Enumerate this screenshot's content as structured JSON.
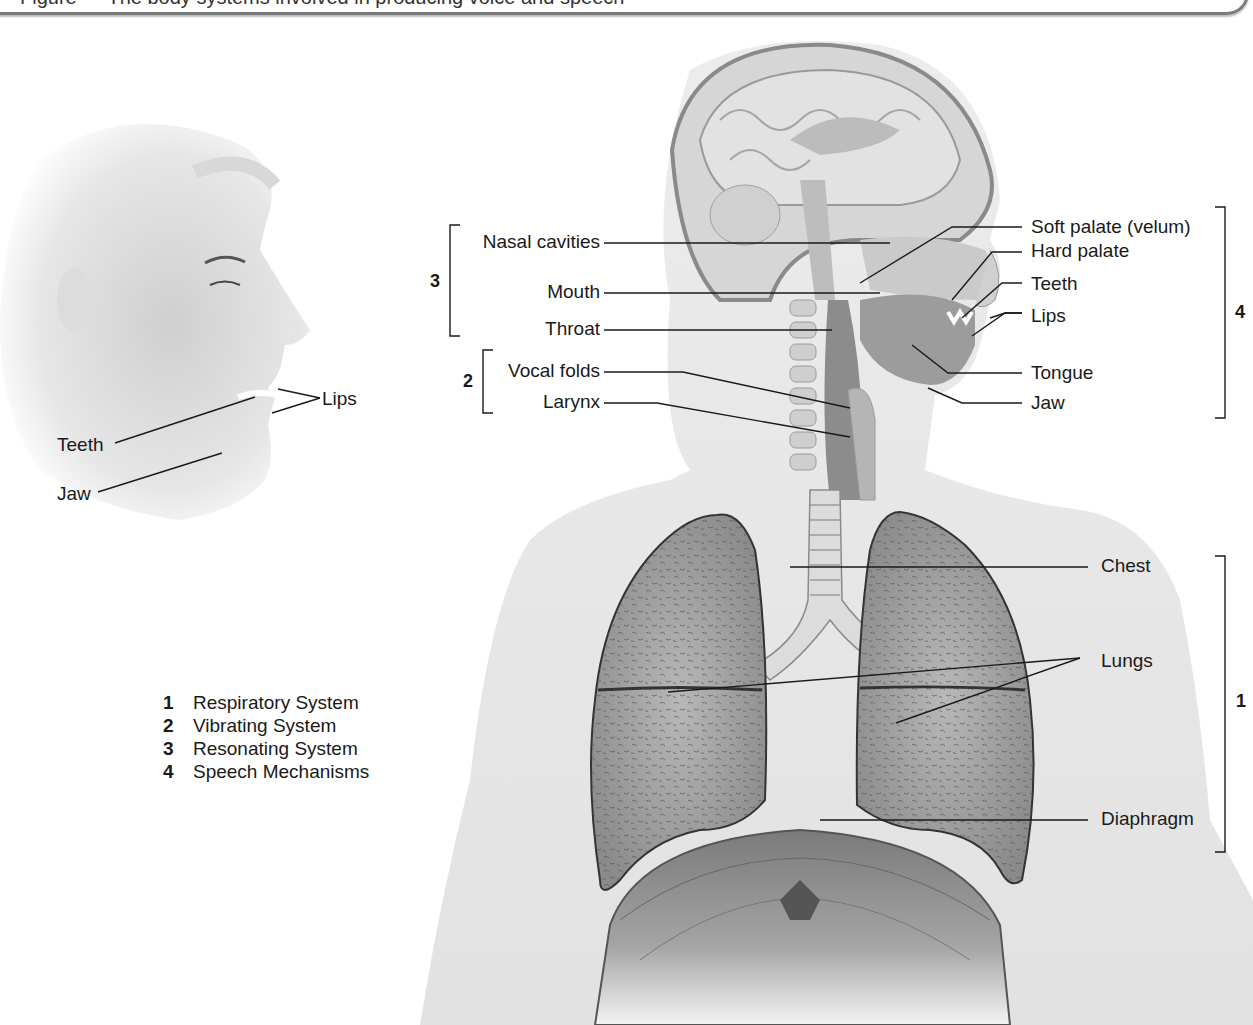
{
  "figure": {
    "caption_partial": "Figure — The body systems involved in producing voice and speech",
    "background": "#ffffff",
    "ink_color": "#1a1a1a"
  },
  "face_labels": {
    "lips": "Lips",
    "teeth": "Teeth",
    "jaw": "Jaw"
  },
  "left_labels": [
    {
      "id": "nasal_cavities",
      "text": "Nasal cavities"
    },
    {
      "id": "mouth",
      "text": "Mouth"
    },
    {
      "id": "throat",
      "text": "Throat"
    },
    {
      "id": "vocal_folds",
      "text": "Vocal folds"
    },
    {
      "id": "larynx",
      "text": "Larynx"
    }
  ],
  "right_labels": [
    {
      "id": "soft_palate",
      "text": "Soft palate (velum)"
    },
    {
      "id": "hard_palate",
      "text": "Hard palate"
    },
    {
      "id": "teeth",
      "text": "Teeth"
    },
    {
      "id": "lips",
      "text": "Lips"
    },
    {
      "id": "tongue",
      "text": "Tongue"
    },
    {
      "id": "jaw",
      "text": "Jaw"
    },
    {
      "id": "chest",
      "text": "Chest"
    },
    {
      "id": "lungs",
      "text": "Lungs"
    },
    {
      "id": "diaphragm",
      "text": "Diaphragm"
    }
  ],
  "brackets": [
    {
      "number": "3",
      "group": "Resonating System"
    },
    {
      "number": "2",
      "group": "Vibrating System"
    },
    {
      "number": "4",
      "group": "Speech Mechanisms"
    },
    {
      "number": "1",
      "group": "Respiratory System"
    }
  ],
  "legend": [
    {
      "number": "1",
      "label": "Respiratory System"
    },
    {
      "number": "2",
      "label": "Vibrating System"
    },
    {
      "number": "3",
      "label": "Resonating System"
    },
    {
      "number": "4",
      "label": "Speech Mechanisms"
    }
  ]
}
